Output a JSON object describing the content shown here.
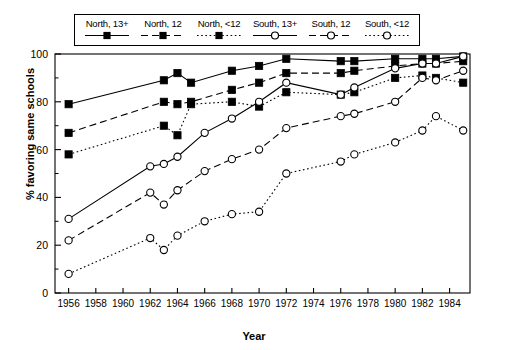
{
  "chart_data": {
    "type": "line",
    "title": "",
    "xlabel": "Year",
    "ylabel": "% favoring same schools",
    "xlim": [
      1955,
      1985.5
    ],
    "ylim": [
      0,
      100
    ],
    "xticks": [
      1956,
      1958,
      1960,
      1962,
      1964,
      1966,
      1968,
      1970,
      1972,
      1974,
      1976,
      1978,
      1980,
      1982,
      1984
    ],
    "xtick_labels": [
      "1956",
      "1958",
      "1960",
      "1962",
      "1964",
      "1966",
      "1968",
      "1970",
      "1972",
      "1974",
      "1976",
      "1978",
      "1980",
      "1982",
      "1984"
    ],
    "yticks": [
      0,
      20,
      40,
      60,
      80,
      100
    ],
    "ytick_labels": [
      "0",
      "20",
      "40",
      "60",
      "80",
      "100"
    ],
    "minor_yticks": [
      10,
      30,
      50,
      70,
      90
    ],
    "grid": false,
    "legend_position": "top",
    "series": [
      {
        "name": "North, 13+",
        "marker": "filled-square",
        "line": "solid",
        "points": [
          {
            "x": 1956,
            "y": 79
          },
          {
            "x": 1963,
            "y": 89
          },
          {
            "x": 1964,
            "y": 92
          },
          {
            "x": 1965,
            "y": 88
          },
          {
            "x": 1968,
            "y": 93
          },
          {
            "x": 1970,
            "y": 95
          },
          {
            "x": 1972,
            "y": 98
          },
          {
            "x": 1976,
            "y": 97
          },
          {
            "x": 1977,
            "y": 97
          },
          {
            "x": 1980,
            "y": 98
          },
          {
            "x": 1982,
            "y": 98
          },
          {
            "x": 1983,
            "y": 98
          },
          {
            "x": 1985,
            "y": 99
          }
        ]
      },
      {
        "name": "North, 12",
        "marker": "filled-square",
        "line": "dashed",
        "points": [
          {
            "x": 1956,
            "y": 67
          },
          {
            "x": 1963,
            "y": 80
          },
          {
            "x": 1964,
            "y": 79
          },
          {
            "x": 1965,
            "y": 80
          },
          {
            "x": 1968,
            "y": 85
          },
          {
            "x": 1970,
            "y": 88
          },
          {
            "x": 1972,
            "y": 92
          },
          {
            "x": 1976,
            "y": 92
          },
          {
            "x": 1977,
            "y": 93
          },
          {
            "x": 1980,
            "y": 95
          },
          {
            "x": 1982,
            "y": 96
          },
          {
            "x": 1983,
            "y": 96
          },
          {
            "x": 1985,
            "y": 97
          }
        ]
      },
      {
        "name": "North, <12",
        "marker": "filled-square",
        "line": "dotted",
        "points": [
          {
            "x": 1956,
            "y": 58
          },
          {
            "x": 1963,
            "y": 70
          },
          {
            "x": 1964,
            "y": 66
          },
          {
            "x": 1965,
            "y": 79
          },
          {
            "x": 1968,
            "y": 80
          },
          {
            "x": 1970,
            "y": 78
          },
          {
            "x": 1972,
            "y": 84
          },
          {
            "x": 1976,
            "y": 83
          },
          {
            "x": 1977,
            "y": 84
          },
          {
            "x": 1980,
            "y": 90
          },
          {
            "x": 1982,
            "y": 91
          },
          {
            "x": 1983,
            "y": 90
          },
          {
            "x": 1985,
            "y": 88
          }
        ]
      },
      {
        "name": "South, 13+",
        "marker": "open-circle",
        "line": "solid",
        "points": [
          {
            "x": 1956,
            "y": 31
          },
          {
            "x": 1962,
            "y": 53
          },
          {
            "x": 1963,
            "y": 54
          },
          {
            "x": 1964,
            "y": 57
          },
          {
            "x": 1966,
            "y": 67
          },
          {
            "x": 1968,
            "y": 73
          },
          {
            "x": 1970,
            "y": 80
          },
          {
            "x": 1972,
            "y": 88
          },
          {
            "x": 1976,
            "y": 83
          },
          {
            "x": 1977,
            "y": 86
          },
          {
            "x": 1980,
            "y": 94
          },
          {
            "x": 1982,
            "y": 96
          },
          {
            "x": 1983,
            "y": 96
          },
          {
            "x": 1985,
            "y": 99
          }
        ]
      },
      {
        "name": "South, 12",
        "marker": "open-circle",
        "line": "dashed",
        "points": [
          {
            "x": 1956,
            "y": 22
          },
          {
            "x": 1962,
            "y": 42
          },
          {
            "x": 1963,
            "y": 37
          },
          {
            "x": 1964,
            "y": 43
          },
          {
            "x": 1966,
            "y": 51
          },
          {
            "x": 1968,
            "y": 56
          },
          {
            "x": 1970,
            "y": 60
          },
          {
            "x": 1972,
            "y": 69
          },
          {
            "x": 1976,
            "y": 74
          },
          {
            "x": 1977,
            "y": 75
          },
          {
            "x": 1980,
            "y": 80
          },
          {
            "x": 1982,
            "y": 90
          },
          {
            "x": 1983,
            "y": 89
          },
          {
            "x": 1985,
            "y": 93
          }
        ]
      },
      {
        "name": "South, <12",
        "marker": "open-circle",
        "line": "dotted",
        "points": [
          {
            "x": 1956,
            "y": 8
          },
          {
            "x": 1962,
            "y": 23
          },
          {
            "x": 1963,
            "y": 18
          },
          {
            "x": 1964,
            "y": 24
          },
          {
            "x": 1966,
            "y": 30
          },
          {
            "x": 1968,
            "y": 33
          },
          {
            "x": 1970,
            "y": 34
          },
          {
            "x": 1972,
            "y": 50
          },
          {
            "x": 1976,
            "y": 55
          },
          {
            "x": 1977,
            "y": 58
          },
          {
            "x": 1980,
            "y": 63
          },
          {
            "x": 1982,
            "y": 68
          },
          {
            "x": 1983,
            "y": 74
          },
          {
            "x": 1985,
            "y": 68
          }
        ]
      }
    ]
  },
  "legend": {
    "entries": [
      {
        "label": "North, 13+",
        "marker": "filled-square",
        "line": "solid"
      },
      {
        "label": "North, 12",
        "marker": "filled-square",
        "line": "dashed"
      },
      {
        "label": "North, <12",
        "marker": "filled-square",
        "line": "dotted"
      },
      {
        "label": "South, 13+",
        "marker": "open-circle",
        "line": "solid"
      },
      {
        "label": "South, 12",
        "marker": "open-circle",
        "line": "dashed"
      },
      {
        "label": "South, <12",
        "marker": "open-circle",
        "line": "dotted"
      }
    ]
  },
  "axis": {
    "x_title": "Year",
    "y_title": "% favoring same schools"
  },
  "colors": {
    "line": "#000000",
    "background": "#ffffff",
    "axis": "#000000"
  }
}
